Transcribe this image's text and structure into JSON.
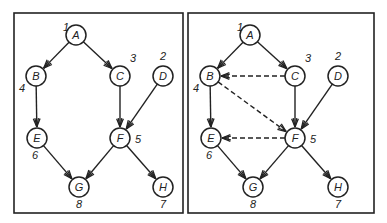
{
  "panels": [
    {
      "id": "left",
      "frame": {
        "x": 14,
        "y": 13,
        "w": 169,
        "h": 200
      },
      "nodes": [
        {
          "id": "A",
          "label": "A",
          "x": 76,
          "y": 35,
          "order": "1",
          "ox": -13,
          "oy": -4
        },
        {
          "id": "B",
          "label": "B",
          "x": 36,
          "y": 76,
          "order": "4",
          "ox": -17,
          "oy": 16
        },
        {
          "id": "C",
          "label": "C",
          "x": 120,
          "y": 76,
          "order": "3",
          "ox": 10,
          "oy": -14
        },
        {
          "id": "D",
          "label": "D",
          "x": 163,
          "y": 76,
          "order": "2",
          "ox": -3,
          "oy": -16
        },
        {
          "id": "E",
          "label": "E",
          "x": 37,
          "y": 138,
          "order": "6",
          "ox": -5,
          "oy": 21
        },
        {
          "id": "F",
          "label": "F",
          "x": 120,
          "y": 138,
          "order": "5",
          "ox": 15,
          "oy": 5
        },
        {
          "id": "G",
          "label": "G",
          "x": 79,
          "y": 187,
          "order": "8",
          "ox": -3,
          "oy": 21
        },
        {
          "id": "H",
          "label": "H",
          "x": 163,
          "y": 187,
          "order": "7",
          "ox": -3,
          "oy": 21
        }
      ],
      "edges": [
        {
          "from": "A",
          "to": "B",
          "style": "solid"
        },
        {
          "from": "A",
          "to": "C",
          "style": "solid"
        },
        {
          "from": "B",
          "to": "E",
          "style": "solid"
        },
        {
          "from": "C",
          "to": "F",
          "style": "solid"
        },
        {
          "from": "D",
          "to": "F",
          "style": "solid"
        },
        {
          "from": "E",
          "to": "G",
          "style": "solid"
        },
        {
          "from": "F",
          "to": "G",
          "style": "solid"
        },
        {
          "from": "F",
          "to": "H",
          "style": "solid"
        }
      ]
    },
    {
      "id": "right",
      "frame": {
        "x": 188,
        "y": 13,
        "w": 186,
        "h": 200
      },
      "nodes": [
        {
          "id": "A",
          "label": "A",
          "x": 250,
          "y": 35,
          "order": "1",
          "ox": -13,
          "oy": -4
        },
        {
          "id": "B",
          "label": "B",
          "x": 210,
          "y": 76,
          "order": "4",
          "ox": -17,
          "oy": 16
        },
        {
          "id": "C",
          "label": "C",
          "x": 295,
          "y": 76,
          "order": "3",
          "ox": 10,
          "oy": -14
        },
        {
          "id": "D",
          "label": "D",
          "x": 338,
          "y": 76,
          "order": "2",
          "ox": -3,
          "oy": -16
        },
        {
          "id": "E",
          "label": "E",
          "x": 211,
          "y": 138,
          "order": "6",
          "ox": -5,
          "oy": 21
        },
        {
          "id": "F",
          "label": "F",
          "x": 295,
          "y": 138,
          "order": "5",
          "ox": 15,
          "oy": 5
        },
        {
          "id": "G",
          "label": "G",
          "x": 253,
          "y": 187,
          "order": "8",
          "ox": -3,
          "oy": 21
        },
        {
          "id": "H",
          "label": "H",
          "x": 338,
          "y": 187,
          "order": "7",
          "ox": -3,
          "oy": 21
        }
      ],
      "edges": [
        {
          "from": "A",
          "to": "B",
          "style": "solid"
        },
        {
          "from": "A",
          "to": "C",
          "style": "solid"
        },
        {
          "from": "B",
          "to": "E",
          "style": "solid"
        },
        {
          "from": "C",
          "to": "F",
          "style": "solid"
        },
        {
          "from": "D",
          "to": "F",
          "style": "solid"
        },
        {
          "from": "E",
          "to": "G",
          "style": "solid"
        },
        {
          "from": "F",
          "to": "G",
          "style": "solid"
        },
        {
          "from": "F",
          "to": "H",
          "style": "solid"
        },
        {
          "from": "C",
          "to": "B",
          "style": "dashed"
        },
        {
          "from": "B",
          "to": "F",
          "style": "dashed"
        },
        {
          "from": "F",
          "to": "E",
          "style": "dashed"
        }
      ]
    }
  ],
  "style": {
    "stroke": "#222222",
    "background": "#ffffff",
    "node_radius": 10
  }
}
